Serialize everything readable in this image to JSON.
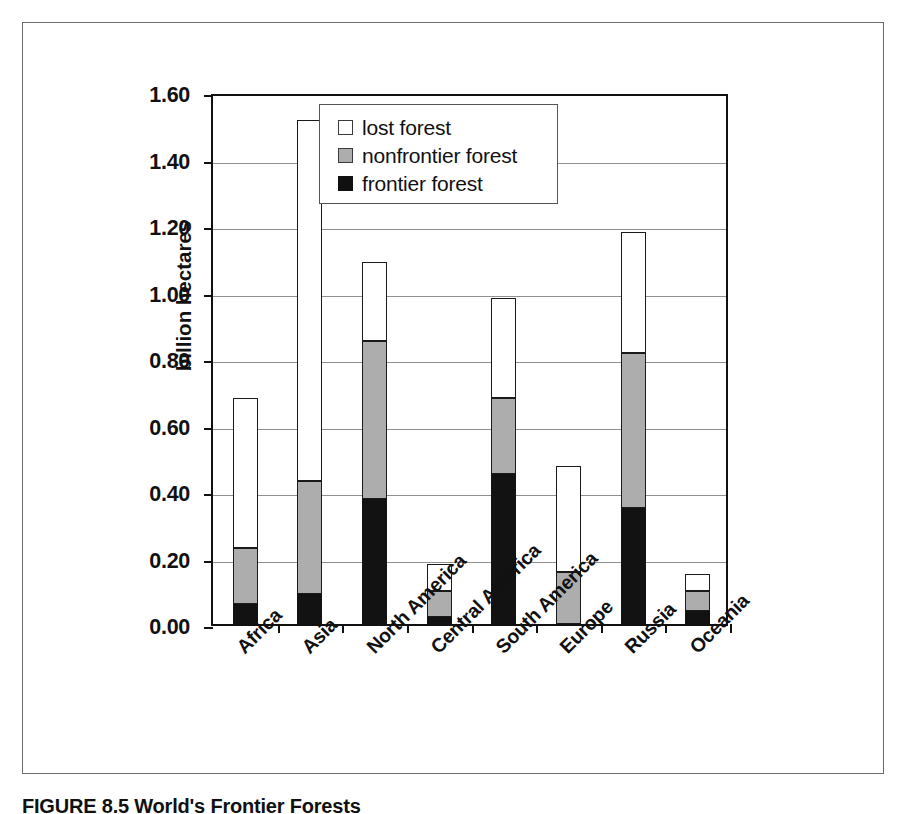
{
  "figure": {
    "caption": "FIGURE 8.5  World's Frontier Forests"
  },
  "chart_data": {
    "type": "bar",
    "subtype": "stacked-bar",
    "title": "",
    "xlabel": "",
    "ylabel": "billion hectares",
    "ylim": [
      0.0,
      1.6
    ],
    "ytick_step": 0.2,
    "ytick_labels": [
      "0.00",
      "0.20",
      "0.40",
      "0.60",
      "0.80",
      "1.00",
      "1.20",
      "1.40",
      "1.60"
    ],
    "ytick_values": [
      0.0,
      0.2,
      0.4,
      0.6,
      0.8,
      1.0,
      1.2,
      1.4,
      1.6
    ],
    "grid": "horizontal",
    "legend_position": "top-center",
    "categories": [
      "Africa",
      "Asia",
      "North America",
      "Central America",
      "South America",
      "Europe",
      "Russia",
      "Oceania"
    ],
    "series": [
      {
        "name": "frontier forest",
        "color": "#121212",
        "values": [
          0.06,
          0.09,
          0.375,
          0.02,
          0.45,
          0.0,
          0.35,
          0.04
        ]
      },
      {
        "name": "nonfrontier forest",
        "color": "#adadad",
        "values": [
          0.17,
          0.34,
          0.475,
          0.08,
          0.23,
          0.155,
          0.465,
          0.06
        ]
      },
      {
        "name": "lost forest",
        "color": "#ffffff",
        "values": [
          0.45,
          1.085,
          0.24,
          0.08,
          0.3,
          0.32,
          0.365,
          0.05
        ]
      }
    ],
    "totals": [
      0.68,
      1.515,
      1.09,
      0.18,
      0.98,
      0.475,
      1.18,
      0.15
    ],
    "cumulative_tops": {
      "frontier": [
        0.06,
        0.09,
        0.375,
        0.02,
        0.45,
        0.0,
        0.35,
        0.04
      ],
      "nonfrontier": [
        0.23,
        0.43,
        0.85,
        0.1,
        0.68,
        0.155,
        0.815,
        0.1
      ],
      "lost": [
        0.68,
        1.515,
        1.09,
        0.18,
        0.98,
        0.475,
        1.18,
        0.15
      ]
    }
  },
  "legend": {
    "entries": [
      {
        "label": "lost forest",
        "swatch": "white"
      },
      {
        "label": "nonfrontier forest",
        "swatch": "gray"
      },
      {
        "label": "frontier forest",
        "swatch": "black"
      }
    ]
  }
}
